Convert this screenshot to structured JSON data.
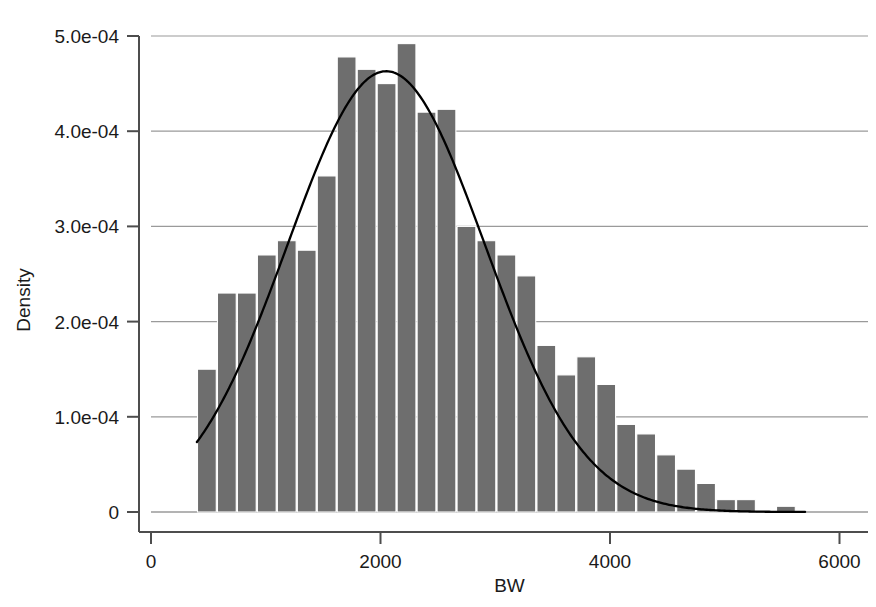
{
  "chart_data": {
    "type": "bar",
    "title": "",
    "subtitle": "",
    "xlabel": "BW",
    "ylabel": "Density",
    "xlim": [
      0,
      6000
    ],
    "ylim": [
      0,
      0.00052
    ],
    "grid": true,
    "legend": null,
    "annotations": [],
    "bar_color": "#6e6e6e",
    "bar_edge_color": "#ffffff",
    "line_color": "#000000",
    "axis_color": "#4d4d4d",
    "grid_color": "#9a9a9a",
    "background_color": "#ffffff",
    "xticks": [
      0,
      2000,
      4000,
      6000
    ],
    "xtick_labels": [
      "0",
      "2000",
      "4000",
      "6000"
    ],
    "yticks": [
      0,
      0.0001,
      0.0002,
      0.0003,
      0.0004,
      0.0005
    ],
    "ytick_labels": [
      "0",
      "1.0e-04",
      "2.0e-04",
      "3.0e-04",
      "4.0e-04",
      "5.0e-04"
    ],
    "bin_width": 174,
    "bin_starts": [
      400,
      574,
      748,
      922,
      1096,
      1270,
      1444,
      1618,
      1792,
      1966,
      2140,
      2314,
      2488,
      2662,
      2836,
      3010,
      3184,
      3358,
      3532,
      3706,
      3880,
      4054,
      4228,
      4402,
      4576,
      4750,
      4924,
      5098,
      5272,
      5446
    ],
    "values": [
      0.00015,
      0.00023,
      0.00023,
      0.00027,
      0.000285,
      0.000275,
      0.000353,
      0.000478,
      0.000465,
      0.00045,
      0.000492,
      0.00042,
      0.000423,
      0.0003,
      0.000285,
      0.00027,
      0.000248,
      0.000175,
      0.000144,
      0.000163,
      0.000134,
      9.2e-05,
      8.2e-05,
      6e-05,
      4.5e-05,
      3e-05,
      1.3e-05,
      1.3e-05,
      0.0,
      6e-06
    ],
    "overlay_curve": {
      "name": "normal-density",
      "type": "line",
      "mean": 2050,
      "sd": 860,
      "peak_value": 0.000463,
      "x_start": 400,
      "x_end": 5700
    }
  },
  "figure": {
    "axis_title_x": "BW",
    "axis_title_y": "Density"
  }
}
